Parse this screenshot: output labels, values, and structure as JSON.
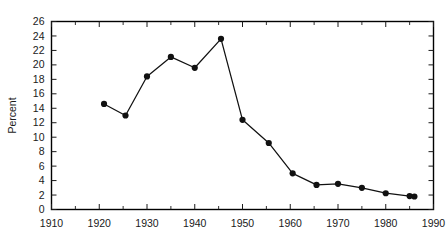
{
  "chart_data": {
    "type": "line",
    "title": "",
    "subtitle": "",
    "xlabel": "",
    "ylabel": "Percent",
    "xlim": [
      1910,
      1990
    ],
    "ylim": [
      0,
      26
    ],
    "grid": false,
    "legend": null,
    "x_major_ticks": [
      1910,
      1920,
      1930,
      1940,
      1950,
      1960,
      1970,
      1980,
      1990
    ],
    "x_tick_labels": [
      "1910",
      "1920",
      "1930",
      "1940",
      "1950",
      "1960",
      "1970",
      "1980",
      "1990"
    ],
    "x_minor_tick_step": 5,
    "y_major_ticks": [
      0,
      2,
      4,
      6,
      8,
      10,
      12,
      14,
      16,
      18,
      20,
      22,
      24,
      26
    ],
    "y_tick_labels": [
      "0",
      "2",
      "4",
      "6",
      "8",
      "10",
      "12",
      "14",
      "16",
      "18",
      "20",
      "22",
      "24",
      "26"
    ],
    "x": [
      1921,
      1925.5,
      1930,
      1935,
      1940,
      1945.5,
      1950,
      1955.5,
      1960.5,
      1965.5,
      1970,
      1975,
      1980,
      1985,
      1986
    ],
    "values": [
      14.6,
      13.0,
      18.4,
      21.1,
      19.6,
      23.6,
      12.4,
      9.2,
      5.0,
      3.4,
      3.55,
      3.0,
      2.25,
      1.85,
      1.8
    ],
    "series": [
      {
        "name": "Percent",
        "marker": "filled-circle",
        "color": "#111111",
        "x": [
          1921,
          1925.5,
          1930,
          1935,
          1940,
          1945.5,
          1950,
          1955.5,
          1960.5,
          1965.5,
          1970,
          1975,
          1980,
          1985,
          1986
        ],
        "values": [
          14.6,
          13.0,
          18.4,
          21.1,
          19.6,
          23.6,
          12.4,
          9.2,
          5.0,
          3.4,
          3.55,
          3.0,
          2.25,
          1.85,
          1.8
        ]
      }
    ]
  },
  "colors": {
    "background": "#ffffff",
    "axis": "#000000",
    "series": "#111111",
    "text": "#1a1a1a"
  }
}
